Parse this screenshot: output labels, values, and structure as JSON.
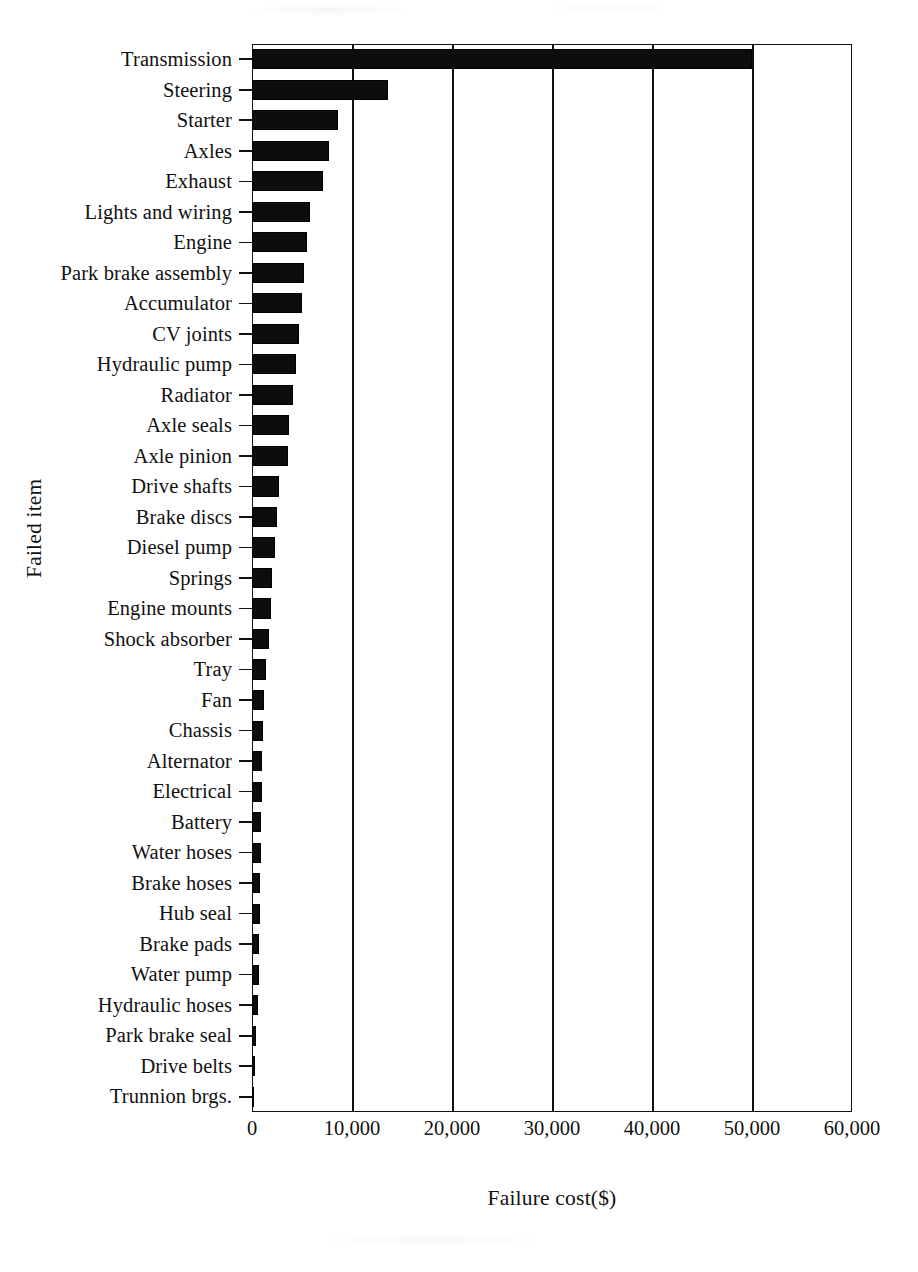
{
  "chart_data": {
    "type": "bar",
    "orientation": "horizontal",
    "title": "",
    "xlabel": "Failure cost($)",
    "ylabel": "Failed item",
    "xlim": [
      0,
      60000
    ],
    "ylim": null,
    "grid": true,
    "legend": null,
    "xticks": [
      "0",
      "10,000",
      "20,000",
      "30,000",
      "40,000",
      "50,000",
      "60,000"
    ],
    "xtick_values": [
      0,
      10000,
      20000,
      30000,
      40000,
      50000,
      60000
    ],
    "categories": [
      "Transmission",
      "Steering",
      "Starter",
      "Axles",
      "Exhaust",
      "Lights and wiring",
      "Engine",
      "Park brake assembly",
      "Accumulator",
      "CV joints",
      "Hydraulic pump",
      "Radiator",
      "Axle seals",
      "Axle pinion",
      "Drive shafts",
      "Brake discs",
      "Diesel pump",
      "Springs",
      "Engine mounts",
      "Shock absorber",
      "Tray",
      "Fan",
      "Chassis",
      "Alternator",
      "Electrical",
      "Battery",
      "Water hoses",
      "Brake hoses",
      "Hub seal",
      "Brake pads",
      "Water pump",
      "Hydraulic hoses",
      "Park brake seal",
      "Drive belts",
      "Trunnion brgs."
    ],
    "values": [
      50000,
      13600,
      8600,
      7700,
      7100,
      5800,
      5500,
      5200,
      5000,
      4700,
      4400,
      4100,
      3700,
      3600,
      2700,
      2500,
      2300,
      2000,
      1900,
      1700,
      1400,
      1200,
      1100,
      1000,
      950,
      900,
      850,
      800,
      750,
      700,
      650,
      600,
      400,
      250,
      120
    ],
    "bar_color": "#0d0d0d"
  }
}
